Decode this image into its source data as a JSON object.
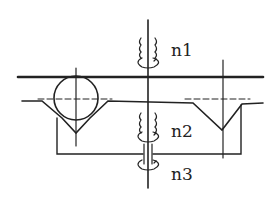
{
  "diagram": {
    "type": "mechanical-schematic",
    "labels": {
      "n1": "n1",
      "n2": "n2",
      "n3": "n3"
    },
    "colors": {
      "line": "#222222",
      "background": "#ffffff"
    }
  }
}
